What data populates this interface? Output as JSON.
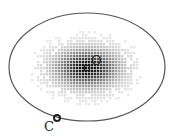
{
  "diagram": {
    "ellipse": {
      "cx": 87,
      "cy": 67,
      "rx": 78,
      "ry": 54,
      "stroke": "#555555"
    },
    "cloud": {
      "cx": 87,
      "cy": 68,
      "sx": 20,
      "sy": 12,
      "extent_rx": 55,
      "extent_ry": 36,
      "color": "#000000"
    },
    "points": [
      {
        "id": "O",
        "label": "O",
        "marker": "square",
        "x": 87,
        "y": 68,
        "label_x": 91,
        "label_y": 54
      },
      {
        "id": "C",
        "label": "C",
        "marker": "circle",
        "x": 57,
        "y": 118,
        "label_x": 44,
        "label_y": 120
      }
    ]
  }
}
